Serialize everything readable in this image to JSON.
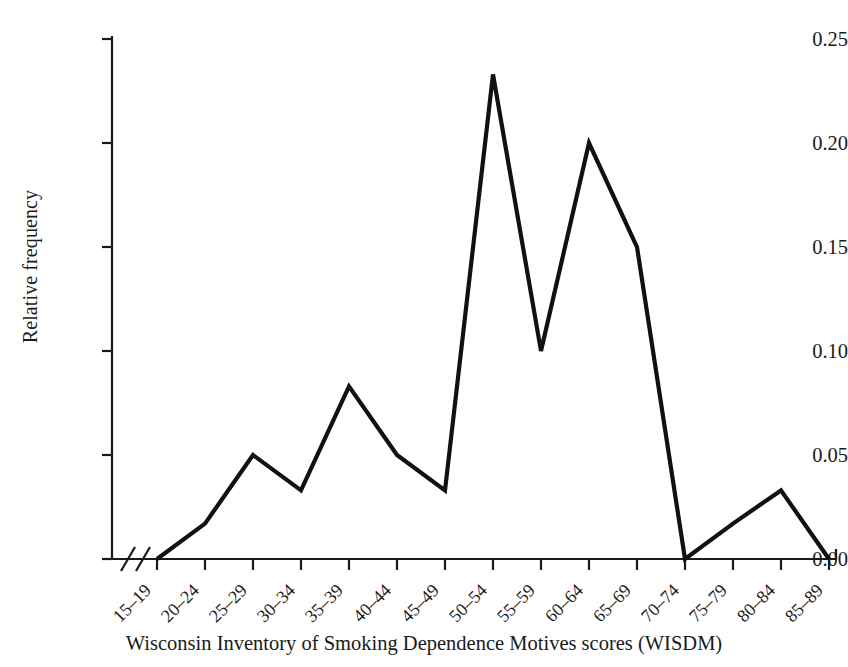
{
  "chart_data": {
    "type": "line",
    "title": "",
    "subtitle": "",
    "xlabel": "Wisconsin Inventory of Smoking Dependence Motives scores (WISDM)",
    "ylabel": "Relative frequency",
    "categories": [
      "15–19",
      "20–24",
      "25–29",
      "30–34",
      "35–39",
      "40–44",
      "45–49",
      "50–54",
      "55–59",
      "60–64",
      "65–69",
      "70–74",
      "75–79",
      "80–84",
      "85–89"
    ],
    "values": [
      0.0,
      0.017,
      0.05,
      0.033,
      0.083,
      0.05,
      0.033,
      0.233,
      0.1,
      0.2,
      0.15,
      0.0,
      0.017,
      0.033,
      0.0
    ],
    "series": [
      {
        "name": "Relative frequency",
        "values": [
          0.0,
          0.017,
          0.05,
          0.033,
          0.083,
          0.05,
          0.033,
          0.233,
          0.1,
          0.2,
          0.15,
          0.0,
          0.017,
          0.033,
          0.0
        ]
      }
    ],
    "ylim": [
      0.0,
      0.25
    ],
    "yticks": [
      0.0,
      0.05,
      0.1,
      0.15,
      0.2,
      0.25
    ],
    "ytick_labels": [
      "0.00",
      "0.05",
      "0.10",
      "0.15",
      "0.20",
      "0.25"
    ],
    "grid": false,
    "legend": false,
    "legend_position": "none",
    "axis_break": "x-axis break between origin and first category",
    "line_color": "#111111",
    "axis_color": "#1a1a1a"
  },
  "axes": {
    "y_label": "Relative frequency",
    "x_label": "Wisconsin Inventory of Smoking Dependence Motives scores (WISDM)"
  }
}
